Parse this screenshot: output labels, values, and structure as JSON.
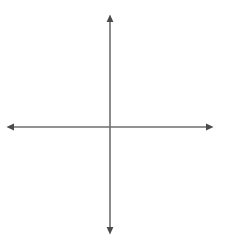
{
  "chart_data": {
    "type": "scatter",
    "title": "",
    "xlabel": "x",
    "ylabel": "y",
    "xlim": [
      -6,
      6
    ],
    "ylim": [
      -6,
      6
    ],
    "x_ticks": [
      -6,
      -5,
      -4,
      -3,
      -2,
      -1,
      1,
      2,
      3,
      4,
      5,
      6
    ],
    "y_ticks": [
      6,
      5,
      4,
      3,
      2,
      1,
      -1,
      -2,
      -3,
      -4,
      -5,
      -6
    ],
    "x_tick_labels": [
      "–6",
      "–5",
      "–4",
      "–3",
      "–2",
      "–1",
      "1",
      "2",
      "3",
      "4",
      "5",
      "6"
    ],
    "y_tick_labels": [
      "6",
      "5",
      "4",
      "3",
      "2",
      "1",
      "–1",
      "–2",
      "–3",
      "–4",
      "–5",
      "–6"
    ],
    "origin_label": "0",
    "grid": true,
    "grid_style": "dotted",
    "minor_grid": true,
    "minor_grid_step": 0.5,
    "legend": null,
    "series": [],
    "values": [],
    "annotations": []
  },
  "axes": {
    "x_name": "x",
    "y_name": "y",
    "arrowheads": [
      "left",
      "right",
      "up",
      "down"
    ]
  },
  "colors": {
    "background": "#ffffff",
    "axis": "#6e6e6e",
    "major_grid": "#b9b9b9",
    "minor_grid": "#dcdcdc",
    "label": "#1b1b1b"
  }
}
